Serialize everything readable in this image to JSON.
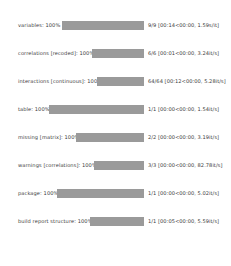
{
  "theme": {
    "background": "#ffffff",
    "bar_color": "#9a9a9a",
    "text_color": "#3b3b3b"
  },
  "progress": {
    "rows": [
      {
        "label": "variables: 100%",
        "percent": 100,
        "stats": "9/9 [00:14<00:00, 1.59s/it]",
        "bar_left": 62,
        "bar_width": 82
      },
      {
        "label": "correlations [recoded]: 100%",
        "percent": 100,
        "stats": "6/6 [00:01<00:00, 3.24it/s]",
        "bar_left": 92,
        "bar_width": 52
      },
      {
        "label": "interactions [continuous]: 100%",
        "percent": 100,
        "stats": "64/64 [00:12<00:00, 5.28it/s]",
        "bar_left": 97,
        "bar_width": 47
      },
      {
        "label": "table: 100%",
        "percent": 100,
        "stats": "1/1 [00:00<00:00, 1.54it/s]",
        "bar_left": 49,
        "bar_width": 95
      },
      {
        "label": "missing [matrix]: 100%",
        "percent": 100,
        "stats": "2/2 [00:00<00:00, 3.19it/s]",
        "bar_left": 76,
        "bar_width": 68
      },
      {
        "label": "warnings [correlations]: 100%",
        "percent": 100,
        "stats": "3/3 [00:00<00:00, 82.78it/s]",
        "bar_left": 94,
        "bar_width": 50
      },
      {
        "label": "package: 100%",
        "percent": 100,
        "stats": "1/1 [00:00<00:00, 5.02it/s]",
        "bar_left": 57,
        "bar_width": 87
      },
      {
        "label": "build report structure: 100%",
        "percent": 100,
        "stats": "1/1 [00:05<00:00, 5.59it/s]",
        "bar_left": 90,
        "bar_width": 54
      }
    ]
  }
}
